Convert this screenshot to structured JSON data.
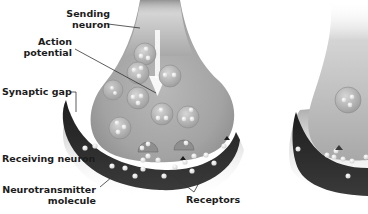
{
  "diagram": {
    "labels": {
      "sending_neuron_line1": "Sending",
      "sending_neuron_line2": "neuron",
      "action_potential_line1": "Action",
      "action_potential_line2": "potential",
      "synaptic_gap": "Synaptic gap",
      "receiving_neuron": "Receiving neuron",
      "neurotransmitter_line1": "Neurotransmitter",
      "neurotransmitter_line2": "molecule",
      "receptors": "Receptors"
    },
    "colors": {
      "background": "#ffffff",
      "sending_neuron_fill": "#a9a9a9",
      "receiving_neuron_fill": "#2a2a2a",
      "vesicle_fill": "#c4c4c4",
      "molecule_fill": "#e8e8e8",
      "label_text": "#1c1c1c",
      "leader_line": "#333333"
    }
  }
}
